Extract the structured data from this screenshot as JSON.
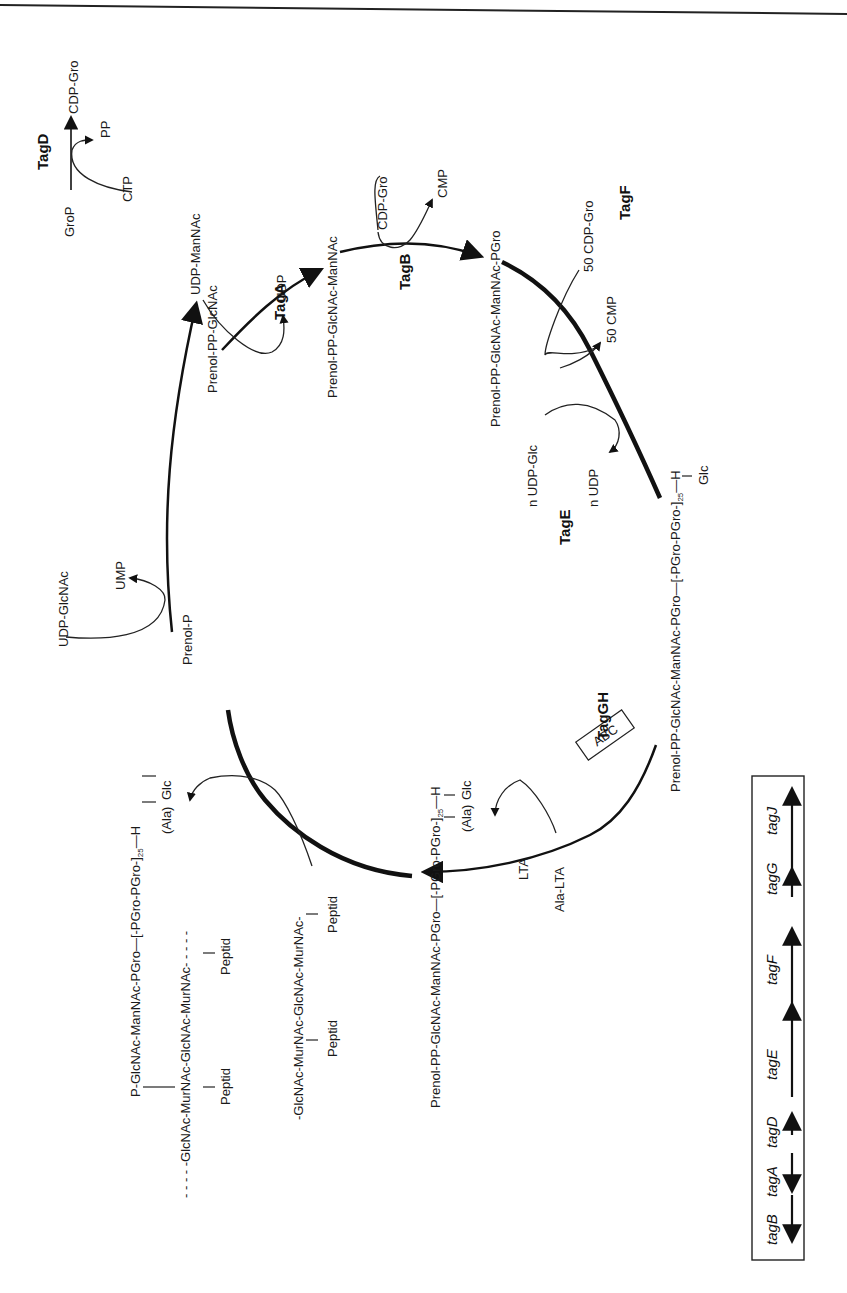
{
  "header": {
    "page_rule": true
  },
  "diagram": {
    "tagD_reaction": {
      "enzyme": "TagD",
      "substrate": "GroP",
      "product": "CDP-Gro",
      "cosubstrate": "CTP",
      "byproduct": "PP"
    },
    "cycle_intermediates": {
      "prenol_p": "Prenol-P",
      "prenol_pp_glcnac": "Prenol-PP-GlcNAc",
      "prenol_pp_glcnac_mannac": "Prenol-PP-GlcNAc-ManNAc",
      "prenol_pp_glcnac_mannac_pgro": "Prenol-PP-GlcNAc-ManNAc-PGro",
      "glc_polymer": "Prenol-PP-GlcNAc-ManNAc-PGro—[-PGro-PGro-]",
      "glc_polymer_sub": "25",
      "glc_polymer_end": "—H",
      "glc_polymer_branch": "Glc",
      "ala_polymer": "Prenol-PP-GlcNAc-ManNAc-PGro—[-PGro-PGro-]",
      "ala_polymer_sub": "25",
      "ala_polymer_end": "—H",
      "ala_polymer_branch_1": "(Ala)",
      "ala_polymer_branch_2": "Glc"
    },
    "side_reactions": {
      "udp_glcnac": "UDP-GlcNAc",
      "ump": "UMP",
      "udp_mannac": "UDP-ManNAc",
      "udp": "UDP",
      "cdp_gro": "CDP-Gro",
      "cmp": "CMP",
      "cdp_gro_50": "50 CDP-Gro",
      "cmp_50": "50 CMP",
      "n_udp_glc": "n UDP-Glc",
      "n_udp": "n UDP",
      "ala_lta": "Ala-LTA",
      "lta": "LTA",
      "abc": "ABC"
    },
    "enzymes": {
      "tagA": "TagA",
      "tagB": "TagB",
      "tagF": "TagF",
      "tagE": "TagE",
      "tagGH": "TagGH"
    },
    "peptidoglycan": {
      "acceptor_chain": "-GlcNAc-MurNAc-GlcNAc-MurNAc-",
      "acceptor_peptid_1": "Peptid",
      "acceptor_peptid_2": "Peptid",
      "product_top": "P-GlcNAc-ManNAc-PGro—[-PGro-PGro-]",
      "product_top_sub": "25",
      "product_top_end": "—H",
      "product_branch_1": "(Ala)",
      "product_branch_2": "Glc",
      "product_chain": "- - - - -GlcNAc-MurNAc-GlcNAc-MurNAc- - - - -",
      "product_peptid_1": "Peptid",
      "product_peptid_2": "Peptid"
    }
  },
  "gene_map": {
    "genes": [
      "tagB",
      "tagA",
      "tagD",
      "tagE",
      "tagF",
      "tagG",
      "tagJ"
    ]
  }
}
